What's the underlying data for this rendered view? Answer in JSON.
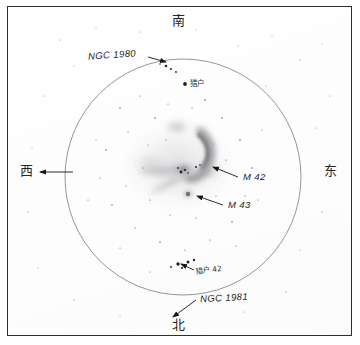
{
  "plate": {
    "title": "Orion Nebula eyepiece sketch",
    "background_color": "#fefefe",
    "border_color": "#2e2e30",
    "ink_color": "#1d1d1f"
  },
  "cardinals": {
    "top": {
      "label": "南",
      "meaning": "south"
    },
    "bottom": {
      "label": "北",
      "meaning": "north"
    },
    "left": {
      "label": "西",
      "meaning": "west"
    },
    "right": {
      "label": "东",
      "meaning": "east"
    }
  },
  "field": {
    "shape": "circle",
    "center_x": 183,
    "center_y": 177,
    "radius": 118,
    "stroke_color": "#8a8a8e"
  },
  "annotations": [
    {
      "id": "ngc1980",
      "label": "NGC 1980",
      "style": "italic",
      "arrow_from_x": 148,
      "arrow_from_y": 57,
      "arrow_to_x": 167,
      "arrow_to_y": 62
    },
    {
      "id": "m42",
      "label": "M 42",
      "style": "italic",
      "arrow_from_x": 238,
      "arrow_from_y": 177,
      "arrow_to_x": 212,
      "arrow_to_y": 166
    },
    {
      "id": "m43",
      "label": "M 43",
      "style": "italic",
      "arrow_from_x": 223,
      "arrow_from_y": 205,
      "arrow_to_x": 196,
      "arrow_to_y": 196
    },
    {
      "id": "ngc1981",
      "label": "NGC 1981",
      "style": "italic",
      "arrow_from_x": 196,
      "arrow_from_y": 300,
      "arrow_to_x": 172,
      "arrow_to_y": 318
    }
  ],
  "star_labels": [
    {
      "id": "orion-upper",
      "label": "猎户",
      "meaning": "Orion",
      "x": 193,
      "y": 84
    },
    {
      "id": "orion-42",
      "label": "猎户 42",
      "meaning": "42 Orionis",
      "x": 196,
      "y": 272
    }
  ],
  "direction_arrow": {
    "id": "west-arrow",
    "from_x": 72,
    "from_y": 172,
    "to_x": 38,
    "to_y": 172
  },
  "nebula": {
    "name": "M 42 / M 43",
    "tone_color": "#9a9a9e",
    "components": [
      {
        "id": "bright-arc",
        "description": "curved bright wing arc"
      },
      {
        "id": "fan-west",
        "description": "diffuse fan sweeping west"
      },
      {
        "id": "trapezium-core",
        "description": "bright core near trapezium"
      },
      {
        "id": "m43-blob",
        "description": "small round detached nebula"
      }
    ]
  }
}
